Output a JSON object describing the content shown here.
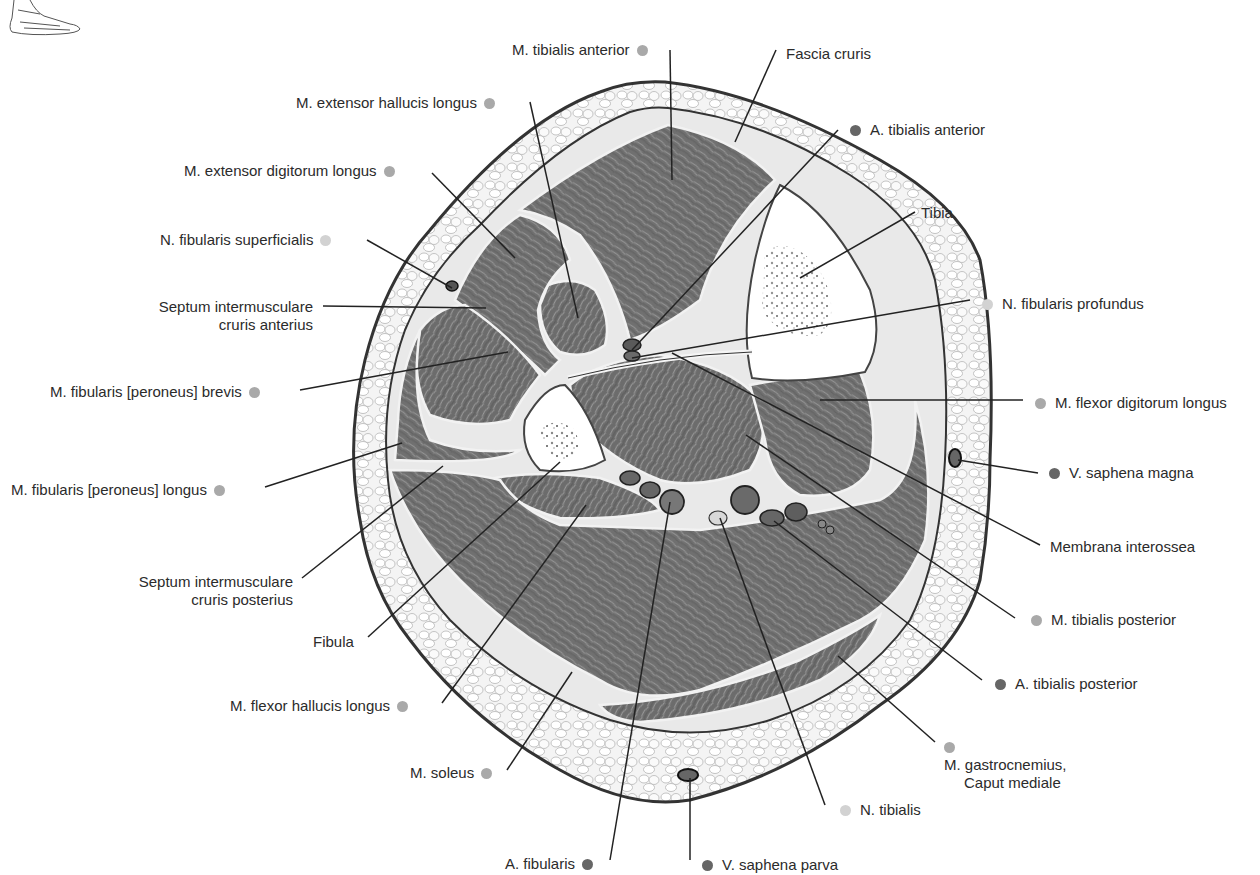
{
  "figure": {
    "orientation_icon": "foot-lateral-view-icon",
    "legend_colors": {
      "muscle": "#a9a9a9",
      "vessel": "#666666",
      "nerve": "#d2d2d2"
    },
    "tissue_colors": {
      "skin_outline": "#333333",
      "subcutaneous_fat": "#f2f2f2",
      "muscle": "#7a7a7a",
      "bone": "#ffffff",
      "fascia": "#e8e8e8"
    }
  },
  "labels": {
    "tibialis_anterior": "M. tibialis anterior",
    "fascia_cruris": "Fascia cruris",
    "extensor_hallucis_longus": "M. extensor hallucis longus",
    "a_tibialis_anterior": "A. tibialis anterior",
    "extensor_digitorum_longus": "M. extensor digitorum longus",
    "tibia": "Tibia",
    "n_fibularis_superficialis": "N. fibularis superficialis",
    "n_fibularis_profundus": "N. fibularis profundus",
    "septum_anterius_line1": "Septum intermusculare",
    "septum_anterius_line2": "cruris anterius",
    "fibularis_brevis": "M. fibularis [peroneus] brevis",
    "flexor_digitorum_longus": "M. flexor digitorum longus",
    "v_saphena_magna": "V. saphena magna",
    "fibularis_longus": "M. fibularis [peroneus] longus",
    "membrana_interossea": "Membrana interossea",
    "septum_posterius_line1": "Septum intermusculare",
    "septum_posterius_line2": "cruris posterius",
    "tibialis_posterior": "M. tibialis posterior",
    "fibula": "Fibula",
    "a_tibialis_posterior": "A. tibialis posterior",
    "flexor_hallucis_longus": "M. flexor hallucis longus",
    "gastrocnemius_line1": "M. gastrocnemius,",
    "gastrocnemius_line2": "Caput mediale",
    "soleus": "M. soleus",
    "n_tibialis": "N. tibialis",
    "a_fibularis": "A. fibularis",
    "v_saphena_parva": "V. saphena parva"
  }
}
